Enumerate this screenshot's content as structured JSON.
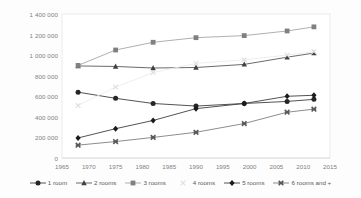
{
  "chart_data": {
    "type": "line",
    "title": "",
    "xlabel": "",
    "ylabel": "",
    "xlim": [
      1965,
      2015
    ],
    "ylim": [
      0,
      1400000
    ],
    "grid": false,
    "legend_position": "bottom",
    "x": [
      1968,
      1975,
      1982,
      1990,
      1999,
      2007,
      2012
    ],
    "x_ticks": [
      "1965",
      "1970",
      "1975",
      "1980",
      "1985",
      "1990",
      "1995",
      "2000",
      "2005",
      "2010",
      "2015"
    ],
    "x_tick_values": [
      1965,
      1970,
      1975,
      1980,
      1985,
      1990,
      1995,
      2000,
      2005,
      2010,
      2015
    ],
    "y_ticks": [
      "0",
      "200 000",
      "400 000",
      "600 000",
      "800 000",
      "1 000 000",
      "1 200 000",
      "1 400 000"
    ],
    "y_tick_values": [
      0,
      200000,
      400000,
      600000,
      800000,
      1000000,
      1200000,
      1400000
    ],
    "series": [
      {
        "name": "1 room",
        "marker": "circle",
        "color": "#262626",
        "line_color": "#404040",
        "values": [
          640000,
          580000,
          530000,
          505000,
          530000,
          550000,
          570000
        ]
      },
      {
        "name": "2 rooms",
        "marker": "triangle",
        "color": "#404040",
        "line_color": "#595959",
        "values": [
          895000,
          890000,
          875000,
          880000,
          910000,
          980000,
          1020000
        ]
      },
      {
        "name": "3 rooms",
        "marker": "square",
        "color": "#808080",
        "line_color": "#a6a6a6",
        "values": [
          900000,
          1050000,
          1125000,
          1170000,
          1190000,
          1235000,
          1275000
        ]
      },
      {
        "name": "4 rooms",
        "marker": "x",
        "color": "#e0e0e0",
        "line_color": "#ececec",
        "values": [
          510000,
          690000,
          830000,
          920000,
          955000,
          1000000,
          1035000
        ]
      },
      {
        "name": "5 rooms",
        "marker": "diamond",
        "color": "#1a1a1a",
        "line_color": "#404040",
        "values": [
          195000,
          285000,
          365000,
          480000,
          530000,
          600000,
          610000
        ]
      },
      {
        "name": "6 rooms and +",
        "marker": "x-bold",
        "color": "#595959",
        "line_color": "#808080",
        "values": [
          125000,
          160000,
          200000,
          250000,
          335000,
          445000,
          475000
        ]
      }
    ]
  },
  "legend": {
    "items": [
      {
        "label": "1 room"
      },
      {
        "label": "2 rooms"
      },
      {
        "label": "3 rooms"
      },
      {
        "label": "4 rooms"
      },
      {
        "label": "5 rooms"
      },
      {
        "label": "6 rooms and +"
      }
    ]
  }
}
